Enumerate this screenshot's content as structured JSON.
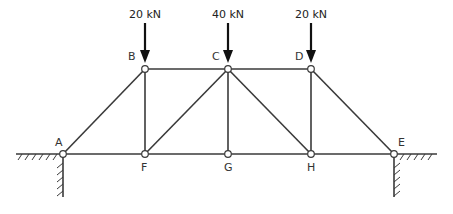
{
  "diagram": {
    "type": "truss",
    "nodes": [
      {
        "id": "A",
        "label": "A",
        "x": 63,
        "y": 154
      },
      {
        "id": "B",
        "label": "B",
        "x": 145,
        "y": 69
      },
      {
        "id": "C",
        "label": "C",
        "x": 228,
        "y": 69
      },
      {
        "id": "D",
        "label": "D",
        "x": 311,
        "y": 69
      },
      {
        "id": "E",
        "label": "E",
        "x": 394,
        "y": 154
      },
      {
        "id": "F",
        "label": "F",
        "x": 145,
        "y": 154
      },
      {
        "id": "G",
        "label": "G",
        "x": 228,
        "y": 154
      },
      {
        "id": "H",
        "label": "H",
        "x": 311,
        "y": 154
      }
    ],
    "members": [
      [
        "A",
        "B"
      ],
      [
        "B",
        "C"
      ],
      [
        "C",
        "D"
      ],
      [
        "D",
        "E"
      ],
      [
        "A",
        "F"
      ],
      [
        "F",
        "G"
      ],
      [
        "G",
        "H"
      ],
      [
        "H",
        "E"
      ],
      [
        "B",
        "F"
      ],
      [
        "C",
        "F"
      ],
      [
        "C",
        "G"
      ],
      [
        "C",
        "H"
      ],
      [
        "D",
        "H"
      ]
    ],
    "loads": [
      {
        "node": "B",
        "label": "20 kN"
      },
      {
        "node": "C",
        "label": "40 kN"
      },
      {
        "node": "D",
        "label": "20 kN"
      }
    ],
    "supports": [
      {
        "node": "A",
        "type": "fixed-ground-left"
      },
      {
        "node": "E",
        "type": "fixed-ground-right"
      }
    ]
  },
  "labels": {
    "A": "A",
    "B": "B",
    "C": "C",
    "D": "D",
    "E": "E",
    "F": "F",
    "G": "G",
    "H": "H",
    "load_B": "20 kN",
    "load_C": "40 kN",
    "load_D": "20 kN"
  }
}
